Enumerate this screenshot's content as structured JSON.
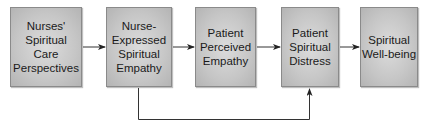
{
  "diagram": {
    "type": "flowchart",
    "nodes": [
      {
        "id": "n1",
        "label": "Nurses'\nSpiritual\nCare\nPerspectives"
      },
      {
        "id": "n2",
        "label": "Nurse-\nExpressed\nSpiritual\nEmpathy"
      },
      {
        "id": "n3",
        "label": "Patient\nPerceived\nEmpathy"
      },
      {
        "id": "n4",
        "label": "Patient\nSpiritual\nDistress"
      },
      {
        "id": "n5",
        "label": "Spiritual\nWell-being"
      }
    ],
    "edges": [
      {
        "from": "n1",
        "to": "n2"
      },
      {
        "from": "n2",
        "to": "n3"
      },
      {
        "from": "n3",
        "to": "n4"
      },
      {
        "from": "n4",
        "to": "n5"
      },
      {
        "from": "n2",
        "to": "n4",
        "route": "below"
      }
    ],
    "colors": {
      "box_fill": "#c6c6c6",
      "box_border": "#8a8a8a",
      "line": "#333333",
      "text": "#1a1a1a"
    }
  }
}
